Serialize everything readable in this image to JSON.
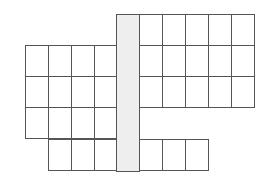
{
  "diagram": {
    "type": "cell-grid",
    "colors": {
      "line": "#555555",
      "cell_fill": "#ffffff",
      "spine_fill": "#eeeeee"
    },
    "spine": {
      "x": 116,
      "y": 14,
      "w": 23,
      "h": 157
    },
    "col_width": 23,
    "row_height": 31,
    "blocks": [
      {
        "name": "left-block",
        "x0": 25,
        "y0": 45,
        "cols": 4,
        "rows": 3
      },
      {
        "name": "left-bottom-row",
        "x0": 48,
        "y0": 139,
        "cols": 3,
        "rows": 1
      },
      {
        "name": "right-block",
        "x0": 139,
        "y0": 14,
        "cols": 5,
        "rows": 3
      },
      {
        "name": "right-bottom-row",
        "x0": 139,
        "y0": 139,
        "cols": 3,
        "rows": 1
      }
    ]
  }
}
